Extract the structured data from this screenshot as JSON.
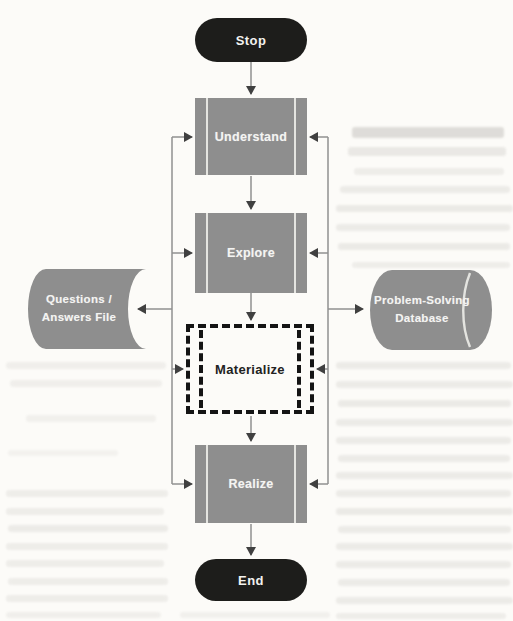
{
  "figure": {
    "type": "flowchart",
    "nodes": {
      "stop": {
        "label": "Stop",
        "shape": "terminator"
      },
      "understand": {
        "label": "Understand",
        "shape": "predefined-process"
      },
      "explore": {
        "label": "Explore",
        "shape": "predefined-process"
      },
      "materialize": {
        "label": "Materialize",
        "shape": "dashed-predefined-process"
      },
      "realize": {
        "label": "Realize",
        "shape": "predefined-process"
      },
      "end": {
        "label": "End",
        "shape": "terminator"
      },
      "qa_file": {
        "label": "Questions / Answers File",
        "line1": "Questions /",
        "line2": "Answers File",
        "shape": "stored-data"
      },
      "database": {
        "label": "Problem-Solving Database",
        "line1": "Problem-Solving",
        "line2": "Database",
        "shape": "direct-access-storage"
      }
    },
    "edges": [
      "Stop -> Understand",
      "Understand -> Explore",
      "Explore -> Materialize",
      "Materialize -> Realize",
      "Realize -> End",
      "left rail -> Understand / Explore / Materialize / Realize",
      "right rail -> Understand / Explore / Materialize / Realize",
      "left rail -> Questions / Answers File",
      "right rail -> Problem-Solving Database"
    ],
    "colors": {
      "page_bg": "#fcfbf8",
      "node_fill": "#8e8e8e",
      "node_bar": "#e4e4e0",
      "node_text": "#f4f4f2",
      "terminal_fill": "#1d1d1b",
      "terminal_text": "#f2f2ef",
      "connector": "#909090",
      "arrowhead": "#404040",
      "dashed": "#141414",
      "materialize_text": "#222222"
    }
  }
}
